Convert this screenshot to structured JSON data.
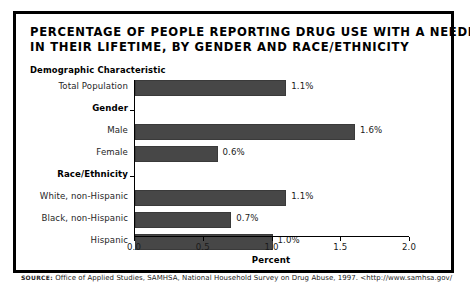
{
  "title": {
    "line1": "PERCENTAGE OF PEOPLE REPORTING DRUG USE WITH A NEEDLE",
    "line2": "IN THEIR LIFETIME, BY GENDER AND RACE/ETHNICITY"
  },
  "axis_head": "Demographic Characteristic",
  "source": {
    "label": "SOURCE:",
    "text": "Office of Applied Studies, SAMHSA, National Household Survey on Drug Abuse, 1997. <http://www.samhsa.gov/"
  },
  "colors": {
    "bar_fill": "#474747",
    "bar_edge": "#3a3a3a",
    "axis": "#000000",
    "frame": "#000000",
    "background": "#ffffff"
  },
  "chart_data": {
    "type": "bar",
    "orientation": "horizontal",
    "title": "PERCENTAGE OF PEOPLE REPORTING DRUG USE WITH A NEEDLE IN THEIR LIFETIME, BY GENDER AND RACE/ETHNICITY",
    "xlabel": "Percent",
    "ylabel": "Demographic Characteristic",
    "xlim": [
      0.0,
      2.0
    ],
    "xticks": [
      "0.0",
      "0.5",
      "1.0",
      "1.5",
      "2.0"
    ],
    "xtick_values": [
      0.0,
      0.5,
      1.0,
      1.5,
      2.0
    ],
    "grid": false,
    "legend": "none",
    "categories": [
      "Total Population",
      "Male",
      "Female",
      "White, non-Hispanic",
      "Black, non-Hispanic",
      "Hispanic"
    ],
    "values": [
      1.1,
      1.6,
      0.6,
      1.1,
      0.7,
      1.0
    ],
    "data_labels": [
      "1.1%",
      "1.6%",
      "0.6%",
      "1.1%",
      "0.7%",
      "1.0%"
    ],
    "group_headers": [
      "Gender",
      "Race/Ethnicity"
    ],
    "rows": [
      {
        "kind": "bar",
        "label": "Total Population",
        "value": 1.1,
        "data_label": "1.1%"
      },
      {
        "kind": "header",
        "label": "Gender",
        "value": null,
        "data_label": ""
      },
      {
        "kind": "bar",
        "label": "Male",
        "value": 1.6,
        "data_label": "1.6%"
      },
      {
        "kind": "bar",
        "label": "Female",
        "value": 0.6,
        "data_label": "0.6%"
      },
      {
        "kind": "header",
        "label": "Race/Ethnicity",
        "value": null,
        "data_label": ""
      },
      {
        "kind": "bar",
        "label": "White, non-Hispanic",
        "value": 1.1,
        "data_label": "1.1%"
      },
      {
        "kind": "bar",
        "label": "Black, non-Hispanic",
        "value": 0.7,
        "data_label": "0.7%"
      },
      {
        "kind": "bar",
        "label": "Hispanic",
        "value": 1.0,
        "data_label": "1.0%"
      }
    ]
  }
}
